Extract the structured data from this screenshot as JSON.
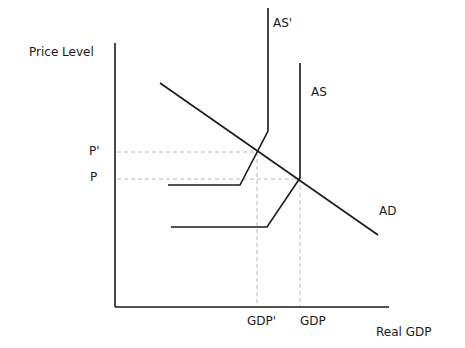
{
  "diagram": {
    "type": "AD-AS",
    "axes": {
      "y_label": "Price Level",
      "x_label": "Real GDP"
    },
    "ticks": {
      "price": [
        "P'",
        "P"
      ],
      "output": [
        "GDP'",
        "GDP"
      ]
    },
    "curves": {
      "ad_label": "AD",
      "as_label": "AS",
      "as_prime_label": "AS'"
    },
    "colors": {
      "line": "#1a1a1a",
      "guide": "#b8b8b8"
    }
  }
}
